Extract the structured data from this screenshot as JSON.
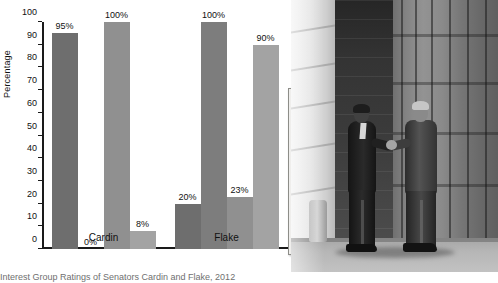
{
  "chart_data": {
    "type": "bar",
    "title": "",
    "xlabel": "",
    "ylabel": "Percentage",
    "ylim": [
      0,
      100
    ],
    "yticks": [
      0,
      10,
      20,
      30,
      40,
      50,
      60,
      70,
      80,
      90,
      100
    ],
    "grid": false,
    "legend_position": "right",
    "categories": [
      "Cardin",
      "Flake"
    ],
    "series": [
      {
        "name": "Americans for Democratic Action",
        "color": "#6e6e6e",
        "values": [
          95,
          20
        ],
        "labels": [
          "95%",
          "20%"
        ]
      },
      {
        "name": "American Conservative Union",
        "color": "#7d7d7d",
        "values": [
          0,
          100
        ],
        "labels": [
          "0%",
          "100%"
        ]
      },
      {
        "name": "The League of Conservation Voters",
        "color": "#909090",
        "values": [
          100,
          23
        ],
        "labels": [
          "100%",
          "23%"
        ]
      },
      {
        "name": "The National Taxpayers Union",
        "color": "#a3a3a3",
        "values": [
          8,
          90
        ],
        "labels": [
          "8%",
          "90%"
        ]
      }
    ]
  },
  "legend": {
    "entries": [
      {
        "label": "Americans for Democratic Action",
        "color": "#6e6e6e"
      },
      {
        "label": "American Conservative Union",
        "color": "#7d7d7d"
      },
      {
        "label": "The League of Conservation Voters",
        "color": "#909090"
      },
      {
        "label": "The National Taxpayers Union",
        "color": "#a3a3a3"
      }
    ]
  },
  "caption": "Interest Group Ratings of Senators Cardin and Flake, 2012",
  "photo": {
    "alt": "Two men in suits shaking hands in front of a classical government building"
  }
}
